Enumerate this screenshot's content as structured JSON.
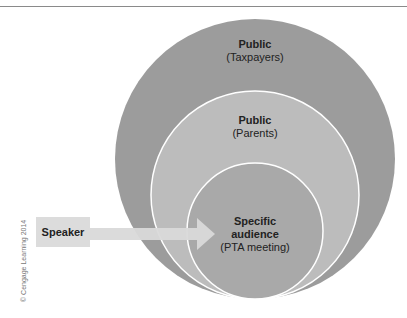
{
  "diagram": {
    "circles": [
      {
        "title": "Public",
        "subtitle": "(Taxpayers)",
        "color": "#9a9a9a"
      },
      {
        "title": "Public",
        "subtitle": "(Parents)",
        "color": "#bdbdbd"
      },
      {
        "title": "Specific audience",
        "title_line1": "Specific",
        "title_line2": "audience",
        "subtitle": "(PTA meeting)",
        "color": "#a8a8a8"
      }
    ],
    "speaker_label": "Speaker",
    "arrow_color": "#d9d9d9",
    "copyright": "© Cengage Learning 2014"
  }
}
